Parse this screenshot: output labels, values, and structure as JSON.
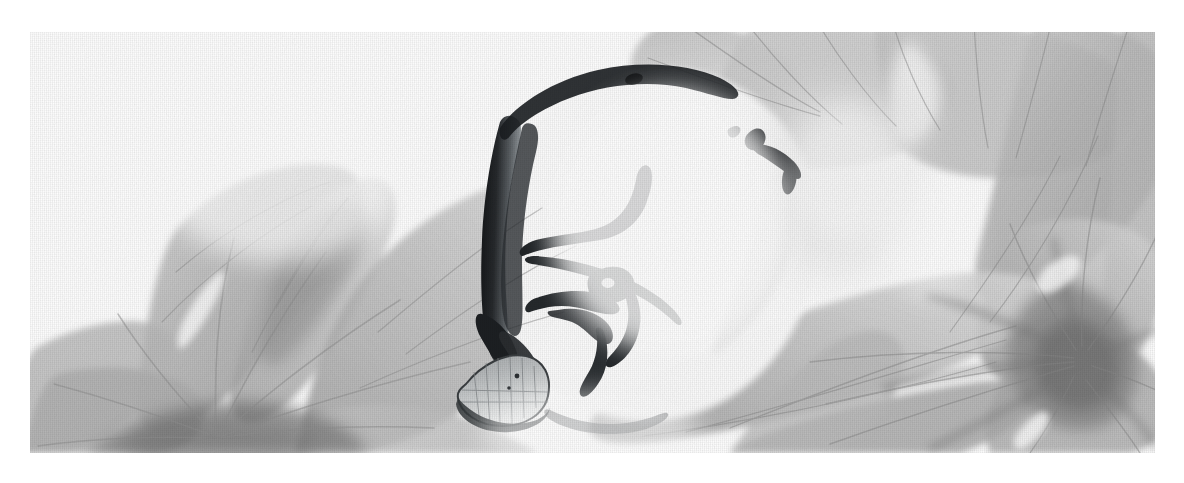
{
  "artwork": {
    "title": "Ink-wash floral study",
    "medium": "Monochrome ink and wash on woven paper",
    "palette": {
      "paper": "#ffffff",
      "wash_lightest": "#e9e9e9",
      "wash_light": "#d6d6d6",
      "wash_mid": "#bdbdbd",
      "wash_midtone": "#ababab",
      "wash_deep": "#949494",
      "wash_darkest": "#7e7e7e",
      "ink_black": "#16181a",
      "ink_soft": "#3c4044"
    },
    "canvas": {
      "width": 1184,
      "height": 483
    },
    "plate": {
      "x": 30,
      "y": 32,
      "width": 1125,
      "height": 421
    },
    "caption": "",
    "subjects": [
      {
        "name": "left-flower",
        "label": "Pale five-petal blossom, lower left",
        "tone": "#b9b9b9"
      },
      {
        "name": "center-ink-fruit",
        "label": "Brush-drawn gourd with dark stem",
        "tone": "#16181a"
      },
      {
        "name": "upper-petals",
        "label": "Translucent petals along the top edge",
        "tone": "#c9c9c9"
      },
      {
        "name": "right-flower",
        "label": "Radiating blossom, right side",
        "tone": "#a9a9a9"
      }
    ]
  }
}
